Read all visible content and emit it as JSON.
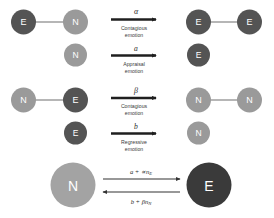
{
  "figure": {
    "background": "#ffffff",
    "colors": {
      "excited_node": "#545454",
      "neutral_node": "#9a9a9a",
      "excited_node_big": "#3a3a3a",
      "neutral_node_big": "#a3a3a3",
      "edge": "#6f6f6f",
      "arrow": "#1f1f1f",
      "text_dark": "#2b2b2b",
      "caption": "#3a3a3a",
      "node_text": "#ffffff"
    }
  },
  "node_labels": {
    "excited": "E",
    "neutral": "N"
  },
  "reactions": [
    {
      "id": "contagious-excitation",
      "rate": "α",
      "caption_line1": "Contagious",
      "caption_line2": "emotion",
      "left": {
        "type": "pair",
        "node_a": {
          "label": "E",
          "state": "excited"
        },
        "node_b": {
          "label": "N",
          "state": "neutral"
        }
      },
      "right": {
        "type": "pair",
        "node_a": {
          "label": "E",
          "state": "excited"
        },
        "node_b": {
          "label": "E",
          "state": "excited"
        }
      }
    },
    {
      "id": "appraisal-excitation",
      "rate": "a",
      "caption_line1": "Appraisal",
      "caption_line2": "emotion",
      "left": {
        "type": "single",
        "node_a": {
          "label": "N",
          "state": "neutral"
        }
      },
      "right": {
        "type": "single",
        "node_a": {
          "label": "E",
          "state": "excited"
        }
      }
    },
    {
      "id": "contagious-relaxation",
      "rate": "β",
      "caption_line1": "Contagious",
      "caption_line2": "emotion",
      "left": {
        "type": "pair",
        "node_a": {
          "label": "N",
          "state": "neutral"
        },
        "node_b": {
          "label": "E",
          "state": "excited"
        }
      },
      "right": {
        "type": "pair",
        "node_a": {
          "label": "N",
          "state": "neutral"
        },
        "node_b": {
          "label": "N",
          "state": "neutral"
        }
      }
    },
    {
      "id": "regressive-relaxation",
      "rate": "b",
      "caption_line1": "Regressive",
      "caption_line2": "emotion",
      "left": {
        "type": "single",
        "node_a": {
          "label": "E",
          "state": "excited"
        }
      },
      "right": {
        "type": "single",
        "node_a": {
          "label": "N",
          "state": "neutral"
        }
      }
    }
  ],
  "summary": {
    "id": "mean-field-summary",
    "left_node": {
      "label": "N",
      "state": "neutral"
    },
    "right_node": {
      "label": "E",
      "state": "excited"
    },
    "forward_rate_main": "a + ∝n",
    "forward_rate_sub": "E",
    "backward_rate_main": "b + βn",
    "backward_rate_sub": "N"
  }
}
